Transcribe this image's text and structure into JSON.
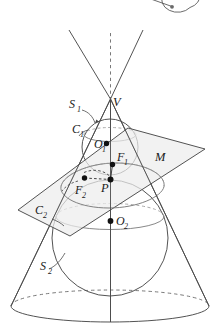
{
  "figure": {
    "background": "#ffffff",
    "stroke": "#4a4a4a",
    "stroke_light": "#8a8a8a",
    "plane_fill": "#eeeeee",
    "point_fill": "#111111"
  },
  "labels": {
    "vertex": "V",
    "sphere_upper": "S",
    "sphere_upper_sub": "1",
    "sphere_lower": "S",
    "sphere_lower_sub": "2",
    "circle_upper": "C",
    "circle_upper_sub": "1",
    "circle_lower": "C",
    "circle_lower_sub": "2",
    "center_upper": "O",
    "center_upper_sub": "1",
    "center_lower": "O",
    "center_lower_sub": "2",
    "focus_upper": "F",
    "focus_upper_sub": "1",
    "focus_lower": "F",
    "focus_lower_sub": "2",
    "point_on_conic": "P",
    "plane": "M"
  },
  "points": [
    {
      "name": "V",
      "x": 110.5,
      "y": 99,
      "dot": false
    },
    {
      "name": "O1",
      "x": 106.5,
      "y": 143.5,
      "dot": true
    },
    {
      "name": "F1",
      "x": 112.5,
      "y": 164.5,
      "dot": true
    },
    {
      "name": "P",
      "x": 110.5,
      "y": 179.5,
      "dot": true
    },
    {
      "name": "F2",
      "x": 84.5,
      "y": 178,
      "dot": true
    },
    {
      "name": "O2",
      "x": 110.5,
      "y": 221,
      "dot": true
    }
  ],
  "geometry": {
    "axis_top_y": 33,
    "axis_bottom_y": 322,
    "cone_left_base_x": 11,
    "cone_right_base_x": 209,
    "base_ellipse_cy": 306,
    "base_ellipse_rx": 99,
    "base_ellipse_ry": 16,
    "sphere1_cx": 110,
    "sphere1_cy": 147,
    "sphere1_r": 28,
    "sphere2_cx": 110,
    "sphere2_cy": 238,
    "sphere2_r": 58
  }
}
